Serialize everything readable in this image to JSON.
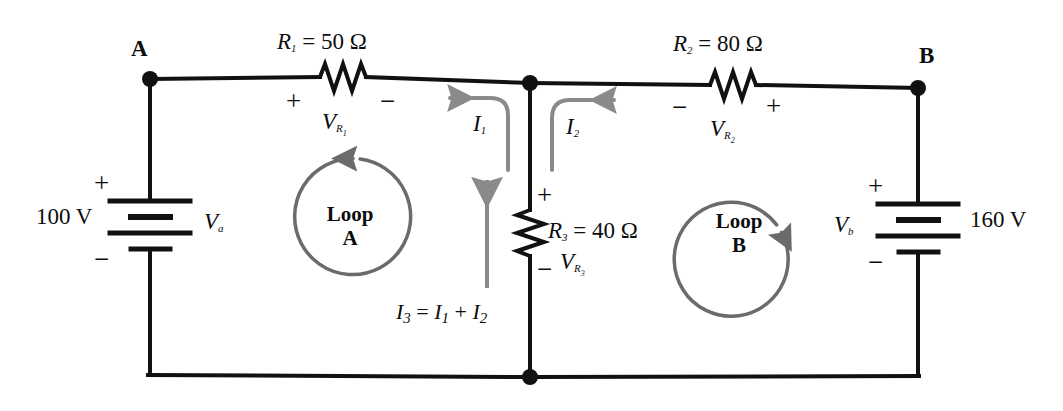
{
  "diagram": {
    "colors": {
      "wire": "#111111",
      "loop_arrow": "#6b6b6b",
      "current_arrow": "#8a8a8a",
      "text": "#0d0d0d",
      "background": "#ffffff"
    }
  },
  "nodes": {
    "a_label": "A",
    "b_label": "B"
  },
  "sources": {
    "left": {
      "value": "100 V",
      "symbol": "V",
      "symbol_sub": "a",
      "plus": "+",
      "minus": "−"
    },
    "right": {
      "value": "160 V",
      "symbol": "V",
      "symbol_sub": "b",
      "plus": "+",
      "minus": "−"
    }
  },
  "resistors": {
    "r1": {
      "name": "R",
      "name_sub": "1",
      "spec": "R",
      "spec_sub": "1",
      "spec_value": " = 50 Ω",
      "drop_symbol": "V",
      "drop_sub": "R",
      "drop_sub2": "1",
      "left_sign": "+",
      "right_sign": "−"
    },
    "r2": {
      "name": "R",
      "name_sub": "2",
      "spec_value": " = 80 Ω",
      "drop_symbol": "V",
      "drop_sub": "R",
      "drop_sub2": "2",
      "left_sign": "−",
      "right_sign": "+"
    },
    "r3": {
      "name": "R",
      "name_sub": "3",
      "spec_value": "  = 40 Ω",
      "drop_symbol": "V",
      "drop_sub": "R",
      "drop_sub2": "3",
      "top_sign": "+",
      "bottom_sign": "−"
    }
  },
  "currents": {
    "i1": {
      "symbol": "I",
      "sub": "1",
      "direction": "left"
    },
    "i2": {
      "symbol": "I",
      "sub": "2",
      "direction": "right"
    },
    "i3": {
      "symbol": "I",
      "sub": "3",
      "direction": "up",
      "equation_lhs": "I",
      "equation_lhs_sub": "3",
      "equation_mid": " = ",
      "equation_t1": "I",
      "equation_t1_sub": "1",
      "equation_plus": " + ",
      "equation_t2": "I",
      "equation_t2_sub": "2"
    }
  },
  "loops": {
    "a": {
      "line1": "Loop",
      "line2": "A",
      "direction": "counterclockwise"
    },
    "b": {
      "line1": "Loop",
      "line2": "B",
      "direction": "clockwise"
    }
  }
}
